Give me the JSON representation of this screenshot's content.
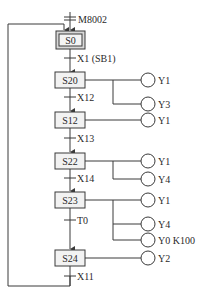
{
  "diagram": {
    "type": "sequential function chart",
    "line_color": "#3a3a3a",
    "step_fill": "#f2f2f2",
    "initial_step_fill": "#d8d8d8",
    "initial_transition": {
      "label": "M8002"
    },
    "steps": [
      {
        "id": "S0",
        "label": "S0",
        "initial": true,
        "outputs": []
      },
      {
        "id": "S20",
        "label": "S20",
        "outputs": [
          {
            "label": "Y1"
          },
          {
            "label": "Y3"
          }
        ]
      },
      {
        "id": "S12",
        "label": "S12",
        "outputs": [
          {
            "label": "Y1"
          }
        ]
      },
      {
        "id": "S22",
        "label": "S22",
        "outputs": [
          {
            "label": "Y1"
          },
          {
            "label": "Y4"
          }
        ]
      },
      {
        "id": "S23",
        "label": "S23",
        "outputs": [
          {
            "label": "Y1"
          },
          {
            "label": "Y4"
          },
          {
            "label": "Y0 K100"
          }
        ]
      },
      {
        "id": "S24",
        "label": "S24",
        "outputs": [
          {
            "label": "Y2"
          }
        ]
      }
    ],
    "transitions": [
      {
        "from": "S0",
        "to": "S20",
        "label": "X1 (SB1)"
      },
      {
        "from": "S20",
        "to": "S12",
        "label": "X12"
      },
      {
        "from": "S12",
        "to": "S22",
        "label": "X13"
      },
      {
        "from": "S22",
        "to": "S23",
        "label": "X14"
      },
      {
        "from": "S23",
        "to": "S24",
        "label": "T0"
      },
      {
        "from": "S24",
        "to": "S0",
        "label": "X11"
      }
    ]
  }
}
